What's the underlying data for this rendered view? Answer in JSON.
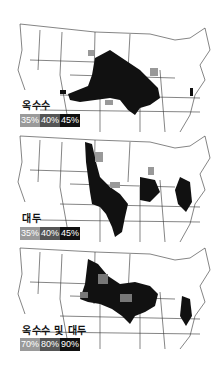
{
  "figure": {
    "panels": [
      {
        "title": "옥수수",
        "legend": [
          {
            "label": "35%",
            "color": "#9a9a9a"
          },
          {
            "label": "40%",
            "color": "#555555"
          },
          {
            "label": "45%",
            "color": "#111111"
          }
        ]
      },
      {
        "title": "대두",
        "legend": [
          {
            "label": "35%",
            "color": "#9a9a9a"
          },
          {
            "label": "40%",
            "color": "#555555"
          },
          {
            "label": "45%",
            "color": "#111111"
          }
        ]
      },
      {
        "title": "옥수수 및 대두",
        "legend": [
          {
            "label": "70%",
            "color": "#9a9a9a"
          },
          {
            "label": "80%",
            "color": "#555555"
          },
          {
            "label": "90%",
            "color": "#111111"
          }
        ]
      }
    ]
  }
}
